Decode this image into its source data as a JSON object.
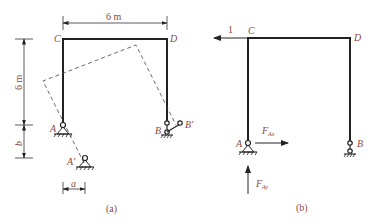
{
  "figure_a": {
    "caption": "(a)",
    "labels": {
      "C": "C",
      "D": "D",
      "A": "A",
      "B": "B",
      "A_prime": "A'",
      "B_prime": "B'"
    },
    "dimensions": {
      "width": "6 m",
      "height": "6 m",
      "settlement_b": "b",
      "settlement_a": "a"
    }
  },
  "figure_b": {
    "caption": "(b)",
    "labels": {
      "C": "C",
      "D": "D",
      "A": "A",
      "B": "B",
      "unit_load": "1",
      "F_Ax": "F",
      "F_Ax_sub": "Ax",
      "F_Ay": "F",
      "F_Ay_sub": "Ay"
    }
  },
  "colors": {
    "label": "#8a4a3c",
    "line": "#222222"
  }
}
